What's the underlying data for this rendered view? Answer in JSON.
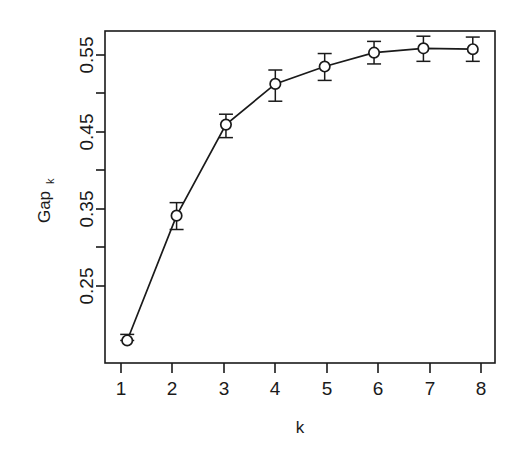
{
  "chart_data": {
    "type": "line",
    "title": "",
    "subtitle": "",
    "xlabel": "k",
    "ylabel": "Gap",
    "ylabel_subscript": "k",
    "x": [
      1,
      2,
      3,
      4,
      5,
      6,
      7,
      8
    ],
    "xtick_labels": [
      "1",
      "2",
      "3",
      "4",
      "5",
      "6",
      "7",
      "8"
    ],
    "ytick_labels": [
      "0.25",
      "0.35",
      "0.45",
      "0.55"
    ],
    "ytick_values": [
      0.25,
      0.35,
      0.45,
      0.55
    ],
    "yminor_values": [
      0.3,
      0.4,
      0.5
    ],
    "xlim": [
      0.55,
      8.45
    ],
    "ylim": [
      0.195,
      0.578
    ],
    "grid": false,
    "legend": null,
    "marker": "open-circle",
    "errorbars": true,
    "series": [
      {
        "name": "Gap_k",
        "values": [
          0.221,
          0.365,
          0.47,
          0.517,
          0.537,
          0.553,
          0.558,
          0.557
        ],
        "err_low": [
          0.221,
          0.349,
          0.455,
          0.497,
          0.521,
          0.54,
          0.543,
          0.543
        ],
        "err_high": [
          0.228,
          0.38,
          0.482,
          0.533,
          0.552,
          0.566,
          0.572,
          0.571
        ]
      }
    ]
  }
}
